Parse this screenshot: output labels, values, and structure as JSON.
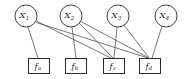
{
  "figure": {
    "kind": "factor-graph",
    "background_color": "#ffffff",
    "node_stroke_color": "#2b2b33",
    "edge_color": "#3c3c46",
    "label_color": "#15151a"
  },
  "variable_nodes": [
    {
      "id": "x1",
      "base": "X",
      "sub": "1",
      "label": "X₁",
      "cx": 26,
      "cy": 16,
      "r": 11
    },
    {
      "id": "x2",
      "base": "X",
      "sub": "2",
      "label": "X₂",
      "cx": 71,
      "cy": 16,
      "r": 11
    },
    {
      "id": "x3",
      "base": "X",
      "sub": "3",
      "label": "X₃",
      "cx": 118,
      "cy": 16,
      "r": 11
    },
    {
      "id": "x4",
      "base": "X",
      "sub": "4",
      "label": "X₄",
      "cx": 166,
      "cy": 16,
      "r": 11
    }
  ],
  "factor_nodes": [
    {
      "id": "fa",
      "base": "f",
      "sub": "a",
      "label": "fₐ",
      "cx": 39,
      "cy": 66,
      "w": 21,
      "h": 15
    },
    {
      "id": "fb",
      "base": "f",
      "sub": "b",
      "label": "fᵇ",
      "cx": 76,
      "cy": 66,
      "w": 21,
      "h": 15
    },
    {
      "id": "fc",
      "base": "f",
      "sub": "c",
      "label": "fᶜ",
      "cx": 114,
      "cy": 66,
      "w": 21,
      "h": 15
    },
    {
      "id": "fd",
      "base": "f",
      "sub": "d",
      "label": "fᵈ",
      "cx": 150,
      "cy": 66,
      "w": 21,
      "h": 15
    }
  ],
  "edges": [
    {
      "id": "e-x1-fa",
      "from": "x1",
      "to": "fa",
      "x1": 28,
      "y1": 27,
      "x2": 38,
      "y2": 58
    },
    {
      "id": "e-x1-fc",
      "from": "x1",
      "to": "fc",
      "x1": 36,
      "y1": 21,
      "x2": 111,
      "y2": 58
    },
    {
      "id": "e-x1-fd",
      "from": "x1",
      "to": "fd",
      "x1": 36.5,
      "y1": 22.5,
      "x2": 148,
      "y2": 58
    },
    {
      "id": "e-x2-fb",
      "from": "x2",
      "to": "fb",
      "x1": 72,
      "y1": 27,
      "x2": 76,
      "y2": 58
    },
    {
      "id": "e-x2-fc",
      "from": "x2",
      "to": "fc",
      "x1": 79,
      "y1": 23,
      "x2": 113,
      "y2": 58
    },
    {
      "id": "e-x2-fd",
      "from": "x2",
      "to": "fd",
      "x1": 80,
      "y1": 21,
      "x2": 149,
      "y2": 58
    },
    {
      "id": "e-x3-fc",
      "from": "x3",
      "to": "fc",
      "x1": 117,
      "y1": 27,
      "x2": 114,
      "y2": 58
    },
    {
      "id": "e-x3-fd",
      "from": "x3",
      "to": "fd",
      "x1": 124,
      "y1": 25,
      "x2": 149,
      "y2": 58
    },
    {
      "id": "e-x4-fd",
      "from": "x4",
      "to": "fd",
      "x1": 162,
      "y1": 26,
      "x2": 152,
      "y2": 58
    }
  ]
}
